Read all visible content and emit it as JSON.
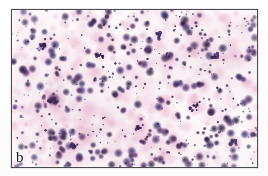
{
  "figure": {
    "panel_label": "b",
    "alt_description": "Photomicrograph of a stained cytology smear showing numerous pink-magenta stained cells with dark purple nuclei scattered on a pale background",
    "border_color": "#4a4a52",
    "background_color": "#ffffff"
  },
  "micrograph": {
    "stain_palette": {
      "cytoplasm_pink": "#e7a8c6",
      "cytoplasm_pale": "#f3d3e2",
      "nucleus_purple": "#4a2a66",
      "nucleus_dark": "#2b1b45",
      "nucleus_navy": "#32276b",
      "background": "#fdf8fa",
      "debris_violet": "#6b4a8c"
    },
    "field": {
      "large_cluster_x_pct": 17,
      "large_cluster_y_pct": 57,
      "cell_count_approx": 420,
      "nucleus_count_approx": 330
    }
  }
}
